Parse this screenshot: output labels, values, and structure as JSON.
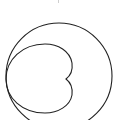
{
  "figure": {
    "stroke_color": "#222222",
    "background": "#ffffff",
    "outer_circle": {
      "cx": 59,
      "cy": 76,
      "r": 53
    },
    "cardioid": {
      "left_x": 6,
      "cusp": [
        66,
        79
      ],
      "top_y": 44,
      "bottom_y": 113,
      "right_x": 72
    }
  }
}
